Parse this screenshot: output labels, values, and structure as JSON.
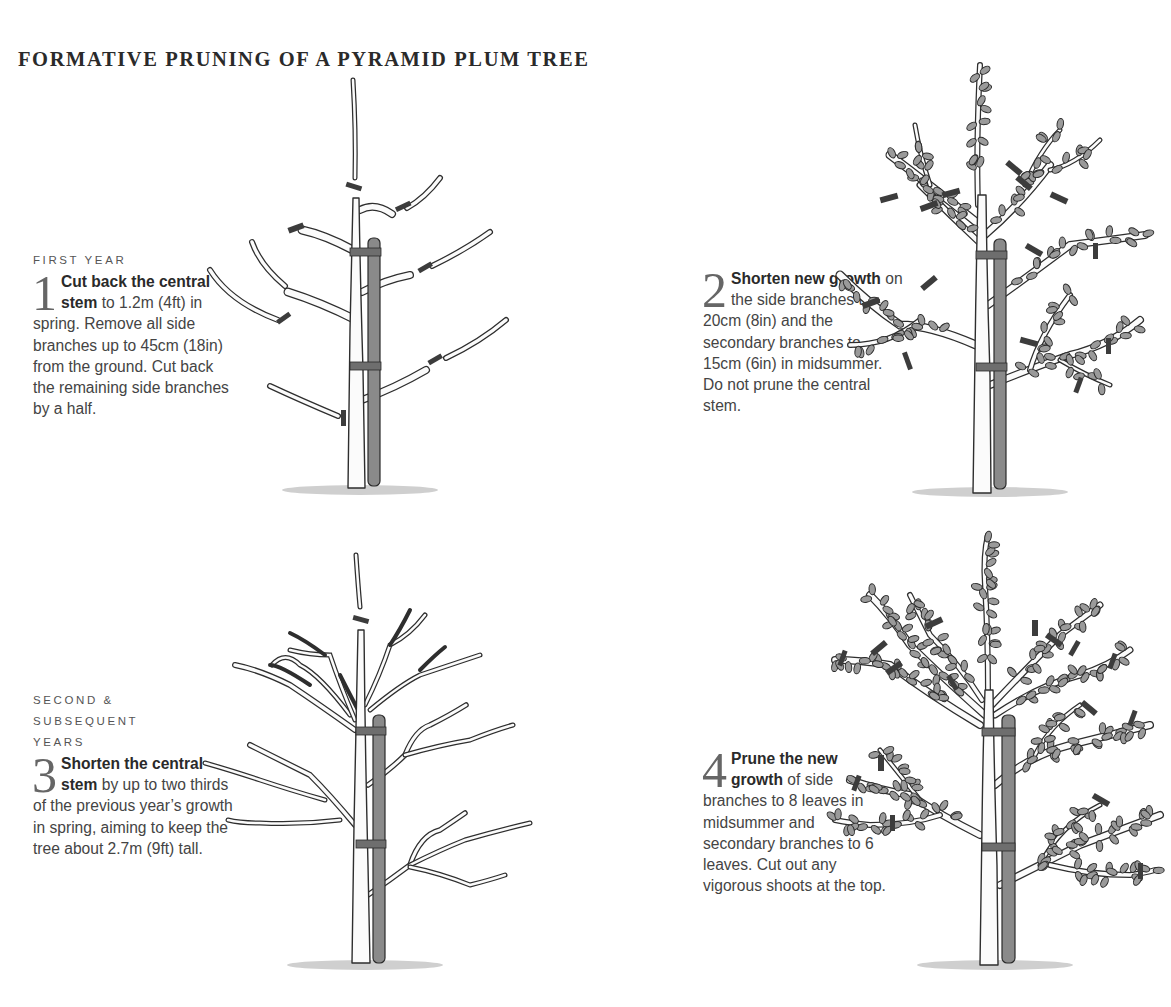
{
  "title": "FORMATIVE PRUNING OF A PYRAMID PLUM TREE",
  "steps": [
    {
      "kicker": "FIRST YEAR",
      "number": "1",
      "lead": "Cut back the central stem",
      "body": " to 1.2m (4ft) in spring. Remove all side branches up to 45cm (18in) from the ground. Cut back the remaining side branches by a half."
    },
    {
      "kicker": "",
      "number": "2",
      "lead": "Shorten new growth",
      "body": " on the side branches to 20cm (8in) and the secondary branches to 15cm (6in) in midsummer. Do not prune the central stem."
    },
    {
      "kicker": "SECOND & SUBSEQUENT YEARS",
      "number": "3",
      "lead": "Shorten the central stem",
      "body": " by up to two thirds of the previous year’s growth in spring, aiming to keep the tree about 2.7m (9ft) tall."
    },
    {
      "kicker": "",
      "number": "4",
      "lead": "Prune the new growth",
      "body": " of side branches to 8 leaves in midsummer and secondary branches to 6 leaves. Cut out any vigorous shoots at the top."
    }
  ],
  "illustrations": [
    {
      "id": "tree-1",
      "depicts": "young bare tree with cut marks on central stem and side branches, tied to stake"
    },
    {
      "id": "tree-2",
      "depicts": "leafy tree with cut marks on side and secondary branches, tied to stake"
    },
    {
      "id": "tree-3",
      "depicts": "older bare branched tree with cut mark on central stem, tied to stake"
    },
    {
      "id": "tree-4",
      "depicts": "mature leafy tree with many cut marks on new growth, tied to stake"
    }
  ],
  "colors": {
    "text": "#444444",
    "heading": "#2a2a2a",
    "stake": "#8a8a8a",
    "cut_mark": "#3c3c3c",
    "leaf": "#9a9a9a"
  }
}
